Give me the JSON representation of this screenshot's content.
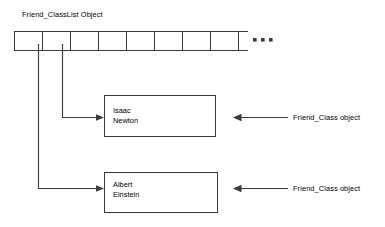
{
  "diagram": {
    "title": "Friend_ClassList Object",
    "array": {
      "name": "friend-classlist-array",
      "cell_count": 8,
      "ellipsis": "...",
      "x": 14,
      "y": 31,
      "cell_width": 28,
      "cell_height": 19,
      "tail_extra": 10
    },
    "objects": [
      {
        "id": "isaac-newton",
        "first_name": "Isaac",
        "last_name": "Newton",
        "annotation": "Friend_Class object",
        "from_cell_index": 1,
        "x": 104,
        "y": 95,
        "width": 112,
        "height": 42
      },
      {
        "id": "albert-einstein",
        "first_name": "Albert",
        "last_name": "Einstein",
        "annotation": "Friend_Class object",
        "from_cell_index": 0,
        "x": 104,
        "y": 172,
        "width": 114,
        "height": 41
      }
    ],
    "colors": {
      "stroke": "#3a3a3a",
      "background": "#ffffff",
      "text": "#000000"
    }
  }
}
